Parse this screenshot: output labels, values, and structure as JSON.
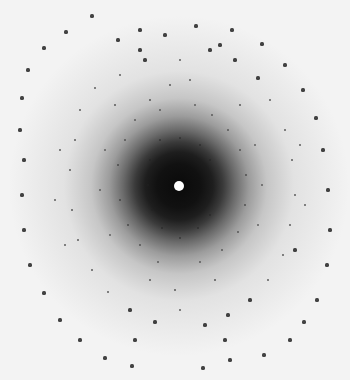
{
  "image": {
    "subject": "X-ray diffraction pattern",
    "width": 350,
    "height": 380,
    "background_color": "#f3f3f3",
    "center": {
      "x": 179,
      "y": 186
    },
    "beamstop_color": "#ffffff",
    "spot_color": "#222222"
  },
  "spots": [
    [
      92,
      16
    ],
    [
      66,
      32
    ],
    [
      44,
      48
    ],
    [
      28,
      70
    ],
    [
      22,
      98
    ],
    [
      20,
      130
    ],
    [
      24,
      160
    ],
    [
      22,
      195
    ],
    [
      24,
      230
    ],
    [
      30,
      265
    ],
    [
      44,
      293
    ],
    [
      60,
      320
    ],
    [
      80,
      340
    ],
    [
      105,
      358
    ],
    [
      132,
      366
    ],
    [
      196,
      26
    ],
    [
      232,
      30
    ],
    [
      262,
      44
    ],
    [
      285,
      65
    ],
    [
      303,
      90
    ],
    [
      316,
      118
    ],
    [
      323,
      150
    ],
    [
      328,
      190
    ],
    [
      330,
      230
    ],
    [
      327,
      265
    ],
    [
      317,
      300
    ],
    [
      304,
      322
    ],
    [
      290,
      340
    ],
    [
      264,
      355
    ],
    [
      230,
      360
    ],
    [
      203,
      368
    ],
    [
      118,
      40
    ],
    [
      140,
      30
    ],
    [
      165,
      35
    ],
    [
      145,
      60
    ],
    [
      120,
      75
    ],
    [
      95,
      88
    ],
    [
      80,
      110
    ],
    [
      75,
      140
    ],
    [
      70,
      170
    ],
    [
      72,
      210
    ],
    [
      78,
      240
    ],
    [
      92,
      270
    ],
    [
      108,
      292
    ],
    [
      130,
      310
    ],
    [
      155,
      322
    ],
    [
      210,
      50
    ],
    [
      235,
      60
    ],
    [
      258,
      78
    ],
    [
      270,
      100
    ],
    [
      285,
      130
    ],
    [
      292,
      160
    ],
    [
      295,
      195
    ],
    [
      290,
      225
    ],
    [
      283,
      255
    ],
    [
      268,
      280
    ],
    [
      250,
      300
    ],
    [
      228,
      315
    ],
    [
      205,
      325
    ],
    [
      150,
      100
    ],
    [
      160,
      110
    ],
    [
      135,
      120
    ],
    [
      125,
      140
    ],
    [
      118,
      165
    ],
    [
      120,
      200
    ],
    [
      128,
      225
    ],
    [
      140,
      245
    ],
    [
      158,
      262
    ],
    [
      200,
      262
    ],
    [
      222,
      250
    ],
    [
      238,
      232
    ],
    [
      245,
      205
    ],
    [
      246,
      175
    ],
    [
      240,
      150
    ],
    [
      228,
      130
    ],
    [
      212,
      115
    ],
    [
      195,
      105
    ],
    [
      105,
      150
    ],
    [
      100,
      190
    ],
    [
      110,
      235
    ],
    [
      255,
      145
    ],
    [
      262,
      185
    ],
    [
      258,
      225
    ],
    [
      170,
      85
    ],
    [
      190,
      80
    ],
    [
      175,
      290
    ],
    [
      150,
      280
    ],
    [
      215,
      280
    ],
    [
      240,
      105
    ],
    [
      115,
      105
    ],
    [
      160,
      140
    ],
    [
      150,
      160
    ],
    [
      148,
      185
    ],
    [
      152,
      210
    ],
    [
      162,
      228
    ],
    [
      198,
      228
    ],
    [
      210,
      215
    ],
    [
      214,
      190
    ],
    [
      210,
      160
    ],
    [
      200,
      145
    ],
    [
      180,
      138
    ],
    [
      180,
      238
    ],
    [
      60,
      150
    ],
    [
      55,
      200
    ],
    [
      65,
      245
    ],
    [
      300,
      145
    ],
    [
      305,
      205
    ],
    [
      295,
      250
    ],
    [
      180,
      60
    ],
    [
      180,
      310
    ],
    [
      135,
      340
    ],
    [
      225,
      340
    ],
    [
      140,
      50
    ],
    [
      220,
      45
    ]
  ],
  "spot_sizes_note": "outer ring spots larger/darker, inner lattice spots smaller"
}
